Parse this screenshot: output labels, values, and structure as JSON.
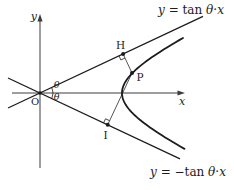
{
  "figure": {
    "colors": {
      "background": "#ffffff",
      "ink": "#1c1c1c",
      "axis": "#3d3d3d"
    },
    "labels": {
      "y_axis": "y",
      "x_axis": "x",
      "origin": "O",
      "theta_upper": "θ",
      "theta_lower": "θ",
      "point_h": "H",
      "point_p": "P",
      "point_i": "I",
      "upper_asymptote": {
        "p1": "y",
        "p2": " = tan ",
        "p3": "θ",
        "p4": "·",
        "p5": "x"
      },
      "lower_asymptote": {
        "p1": "y",
        "p2": " = −tan ",
        "p3": "θ",
        "p4": "·",
        "p5": "x"
      }
    },
    "geometry": {
      "origin": [
        40,
        93
      ],
      "slope": 0.47,
      "theta_deg": 25.2,
      "x_axis_range": [
        12,
        185
      ],
      "y_axis_range": [
        168,
        14
      ],
      "asymptote_left_x": 8,
      "asymptote_upper_right_x": 203,
      "asymptote_lower_right_x": 180,
      "hyperbola": {
        "a": 82,
        "b": 38.5,
        "upper_end_x": 183,
        "lower_end_x": 184.5
      },
      "P": [
        132,
        73
      ],
      "angle_arc_radius": 13,
      "right_angle_size": 4.5
    }
  }
}
